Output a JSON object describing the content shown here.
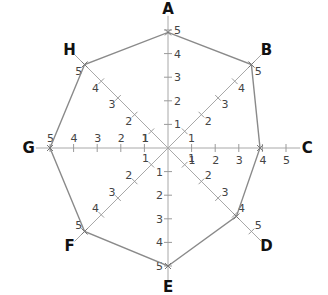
{
  "diagram": {
    "type": "radar",
    "center": [
      168,
      148
    ],
    "unit_px": 23.6,
    "max": 5,
    "colors": {
      "axis": "#a8a8a8",
      "polygon": "#8a8a8a",
      "label": "#111111",
      "tick_label": "#444444"
    }
  },
  "chart_data": {
    "type": "radar",
    "categories": [
      "A",
      "B",
      "C",
      "D",
      "E",
      "F",
      "G",
      "H"
    ],
    "values": [
      4.9,
      5,
      3.9,
      4.1,
      5,
      5,
      5,
      5
    ],
    "scale_ticks": [
      1,
      2,
      3,
      4,
      5
    ],
    "range": [
      0,
      5
    ],
    "title": "",
    "grid": false,
    "legend": "none"
  },
  "axes": [
    {
      "name": "A",
      "angle": -90
    },
    {
      "name": "B",
      "angle": -45
    },
    {
      "name": "C",
      "angle": 0
    },
    {
      "name": "D",
      "angle": 45
    },
    {
      "name": "E",
      "angle": 90
    },
    {
      "name": "F",
      "angle": 135
    },
    {
      "name": "G",
      "angle": 180
    },
    {
      "name": "H",
      "angle": 225
    }
  ]
}
